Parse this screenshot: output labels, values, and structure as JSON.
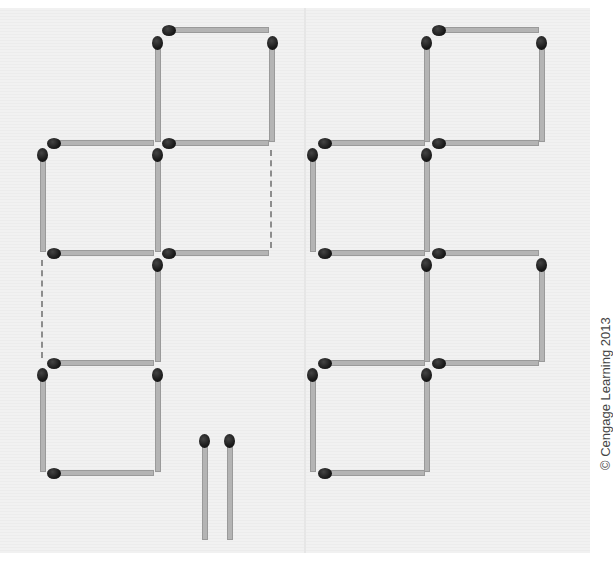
{
  "figure": {
    "colors": {
      "stick": "#b4b4b4",
      "stick_edge": "#9a9a9a",
      "head": "#1b1b1b",
      "dashed_line": "#8d8d8d",
      "background": "#f0f0f0"
    },
    "left_arrangement": {
      "name": "left",
      "squares": 4,
      "dashed_gaps": 2,
      "loose_matches": 2
    },
    "right_arrangement": {
      "name": "right",
      "squares": 5
    }
  },
  "credit": "© Cengage Learning 2013"
}
